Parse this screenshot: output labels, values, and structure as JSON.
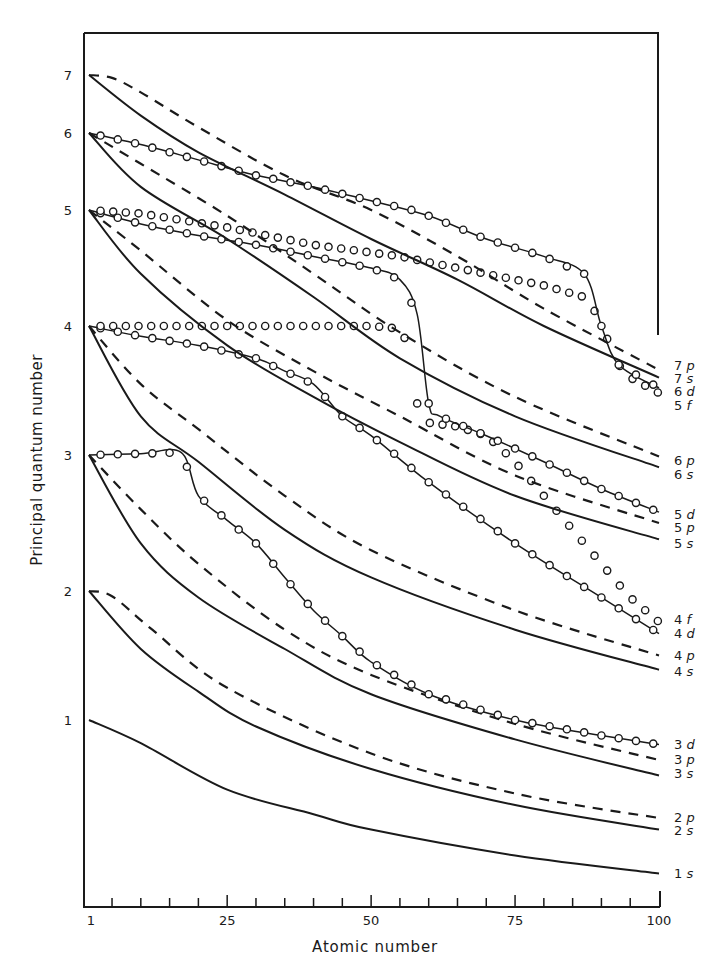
{
  "chart_data": {
    "type": "line",
    "title": "",
    "xlabel": "Atomic number",
    "ylabel": "Principal quantum number",
    "xlim": [
      1,
      100
    ],
    "ylim": [
      -0.3,
      7.5
    ],
    "x_ticks": [
      1,
      25,
      50,
      75,
      100
    ],
    "x_minor_tick_step": 5,
    "y_ticks": [
      1,
      2,
      3,
      4,
      5,
      6,
      7
    ],
    "y_scale_note": "non-linear, compressed at high n",
    "grid": false,
    "legend_position": "right (labels at curve ends)",
    "series": [
      {
        "name": "1s",
        "style": "solid",
        "points": [
          [
            1,
            1
          ],
          [
            10,
            0.82
          ],
          [
            25,
            0.46
          ],
          [
            40,
            0.27
          ],
          [
            50,
            0.15
          ],
          [
            75,
            -0.05
          ],
          [
            100,
            -0.19
          ]
        ]
      },
      {
        "name": "2s",
        "style": "solid",
        "points": [
          [
            1,
            2
          ],
          [
            10,
            1.55
          ],
          [
            20,
            1.22
          ],
          [
            30,
            0.95
          ],
          [
            50,
            0.62
          ],
          [
            75,
            0.34
          ],
          [
            100,
            0.15
          ]
        ]
      },
      {
        "name": "2p",
        "style": "dashed",
        "points": [
          [
            1,
            2
          ],
          [
            5,
            1.96
          ],
          [
            12,
            1.7
          ],
          [
            25,
            1.25
          ],
          [
            50,
            0.74
          ],
          [
            75,
            0.43
          ],
          [
            100,
            0.24
          ]
        ]
      },
      {
        "name": "3s",
        "style": "solid",
        "points": [
          [
            1,
            3
          ],
          [
            10,
            2.35
          ],
          [
            20,
            1.95
          ],
          [
            35,
            1.55
          ],
          [
            50,
            1.2
          ],
          [
            75,
            0.85
          ],
          [
            100,
            0.57
          ]
        ]
      },
      {
        "name": "3p",
        "style": "dashed",
        "points": [
          [
            1,
            3
          ],
          [
            10,
            2.6
          ],
          [
            20,
            2.2
          ],
          [
            35,
            1.7
          ],
          [
            50,
            1.35
          ],
          [
            75,
            0.97
          ],
          [
            100,
            0.69
          ]
        ]
      },
      {
        "name": "3d",
        "style": "circles-line",
        "points": [
          [
            1,
            3
          ],
          [
            10,
            3.01
          ],
          [
            17,
            3.02
          ],
          [
            20,
            2.7
          ],
          [
            25,
            2.52
          ],
          [
            30,
            2.35
          ],
          [
            35,
            2.1
          ],
          [
            40,
            1.85
          ],
          [
            45,
            1.65
          ],
          [
            50,
            1.45
          ],
          [
            60,
            1.2
          ],
          [
            75,
            1.0
          ],
          [
            90,
            0.88
          ],
          [
            100,
            0.81
          ]
        ]
      },
      {
        "name": "4s",
        "style": "solid",
        "points": [
          [
            1,
            4
          ],
          [
            10,
            3.3
          ],
          [
            20,
            2.95
          ],
          [
            35,
            2.45
          ],
          [
            50,
            2.1
          ],
          [
            75,
            1.7
          ],
          [
            100,
            1.39
          ]
        ]
      },
      {
        "name": "4p",
        "style": "dashed",
        "points": [
          [
            1,
            4
          ],
          [
            10,
            3.55
          ],
          [
            20,
            3.2
          ],
          [
            35,
            2.7
          ],
          [
            50,
            2.3
          ],
          [
            75,
            1.85
          ],
          [
            100,
            1.5
          ]
        ]
      },
      {
        "name": "4d",
        "style": "circles-line",
        "points": [
          [
            1,
            4
          ],
          [
            10,
            3.92
          ],
          [
            20,
            3.85
          ],
          [
            30,
            3.75
          ],
          [
            35,
            3.65
          ],
          [
            40,
            3.55
          ],
          [
            45,
            3.3
          ],
          [
            50,
            3.15
          ],
          [
            60,
            2.8
          ],
          [
            75,
            2.35
          ],
          [
            90,
            1.95
          ],
          [
            100,
            1.67
          ]
        ]
      },
      {
        "name": "4f",
        "style": "circles",
        "points": [
          [
            1,
            4
          ],
          [
            10,
            4.0
          ],
          [
            30,
            4.0
          ],
          [
            50,
            4.0
          ],
          [
            55,
            3.98
          ],
          [
            57,
            3.8
          ],
          [
            58,
            3.4
          ],
          [
            60,
            3.25
          ],
          [
            65,
            3.22
          ],
          [
            70,
            3.15
          ],
          [
            75,
            2.95
          ],
          [
            80,
            2.7
          ],
          [
            85,
            2.45
          ],
          [
            90,
            2.2
          ],
          [
            95,
            1.95
          ],
          [
            100,
            1.76
          ]
        ]
      },
      {
        "name": "5s",
        "style": "solid",
        "points": [
          [
            1,
            5
          ],
          [
            10,
            4.45
          ],
          [
            25,
            3.85
          ],
          [
            40,
            3.45
          ],
          [
            55,
            3.1
          ],
          [
            75,
            2.7
          ],
          [
            100,
            2.38
          ]
        ]
      },
      {
        "name": "5p",
        "style": "dashed",
        "points": [
          [
            1,
            5
          ],
          [
            10,
            4.65
          ],
          [
            25,
            4.05
          ],
          [
            40,
            3.65
          ],
          [
            55,
            3.3
          ],
          [
            75,
            2.85
          ],
          [
            100,
            2.5
          ]
        ]
      },
      {
        "name": "5d",
        "style": "circles-line",
        "points": [
          [
            1,
            5
          ],
          [
            10,
            4.88
          ],
          [
            20,
            4.78
          ],
          [
            30,
            4.7
          ],
          [
            40,
            4.6
          ],
          [
            50,
            4.5
          ],
          [
            55,
            4.4
          ],
          [
            58,
            4.1
          ],
          [
            60,
            3.4
          ],
          [
            62,
            3.3
          ],
          [
            70,
            3.15
          ],
          [
            80,
            2.95
          ],
          [
            90,
            2.75
          ],
          [
            100,
            2.58
          ]
        ]
      },
      {
        "name": "5f",
        "style": "circles",
        "points": [
          [
            1,
            5
          ],
          [
            10,
            4.97
          ],
          [
            25,
            4.85
          ],
          [
            40,
            4.7
          ],
          [
            55,
            4.6
          ],
          [
            70,
            4.45
          ],
          [
            80,
            4.35
          ],
          [
            87,
            4.25
          ],
          [
            90,
            4.05
          ],
          [
            92,
            3.75
          ],
          [
            95,
            3.6
          ],
          [
            100,
            3.48
          ]
        ]
      },
      {
        "name": "6s",
        "style": "solid",
        "points": [
          [
            1,
            6
          ],
          [
            10,
            5.3
          ],
          [
            25,
            4.75
          ],
          [
            40,
            4.25
          ],
          [
            55,
            3.75
          ],
          [
            75,
            3.3
          ],
          [
            100,
            2.91
          ]
        ]
      },
      {
        "name": "6p",
        "style": "dashed",
        "points": [
          [
            1,
            6
          ],
          [
            10,
            5.6
          ],
          [
            25,
            4.95
          ],
          [
            40,
            4.45
          ],
          [
            55,
            3.95
          ],
          [
            75,
            3.45
          ],
          [
            100,
            2.99
          ]
        ]
      },
      {
        "name": "6d",
        "style": "circles-line",
        "points": [
          [
            1,
            6
          ],
          [
            10,
            5.85
          ],
          [
            20,
            5.65
          ],
          [
            30,
            5.45
          ],
          [
            40,
            5.3
          ],
          [
            50,
            5.12
          ],
          [
            60,
            4.95
          ],
          [
            70,
            4.75
          ],
          [
            80,
            4.6
          ],
          [
            87,
            4.45
          ],
          [
            90,
            4.0
          ],
          [
            93,
            3.7
          ],
          [
            100,
            3.52
          ]
        ]
      },
      {
        "name": "7s",
        "style": "solid",
        "points": [
          [
            1,
            7
          ],
          [
            10,
            6.3
          ],
          [
            20,
            5.75
          ],
          [
            35,
            5.2
          ],
          [
            50,
            4.75
          ],
          [
            65,
            4.4
          ],
          [
            80,
            4.0
          ],
          [
            100,
            3.6
          ]
        ]
      },
      {
        "name": "7p",
        "style": "dashed",
        "points": [
          [
            1,
            7
          ],
          [
            5,
            6.95
          ],
          [
            10,
            6.7
          ],
          [
            20,
            6.1
          ],
          [
            35,
            5.45
          ],
          [
            50,
            5.0
          ],
          [
            65,
            4.6
          ],
          [
            80,
            4.15
          ],
          [
            100,
            3.66
          ]
        ]
      }
    ]
  },
  "axes": {
    "xlabel": "Atomic number",
    "ylabel": "Principal quantum number",
    "x_tick_labels": [
      "1",
      "25",
      "50",
      "75",
      "100"
    ],
    "y_tick_labels": [
      "1",
      "2",
      "3",
      "4",
      "5",
      "6",
      "7"
    ]
  },
  "legend_labels": [
    {
      "text": "7p",
      "y": 365
    },
    {
      "text": "7s",
      "y": 378
    },
    {
      "text": "6d",
      "y": 391
    },
    {
      "text": "5f",
      "y": 405
    },
    {
      "text": "6p",
      "y": 460
    },
    {
      "text": "6s",
      "y": 474
    },
    {
      "text": "5d",
      "y": 514
    },
    {
      "text": "5p",
      "y": 527
    },
    {
      "text": "5s",
      "y": 543
    },
    {
      "text": "4f",
      "y": 619
    },
    {
      "text": "4d",
      "y": 633
    },
    {
      "text": "4p",
      "y": 655
    },
    {
      "text": "4s",
      "y": 671
    },
    {
      "text": "3d",
      "y": 744
    },
    {
      "text": "3p",
      "y": 759
    },
    {
      "text": "3s",
      "y": 773
    },
    {
      "text": "2p",
      "y": 817
    },
    {
      "text": "2s",
      "y": 830
    },
    {
      "text": "1s",
      "y": 873
    }
  ],
  "colors": {
    "ink": "#1a1a1a",
    "background": "#ffffff"
  }
}
